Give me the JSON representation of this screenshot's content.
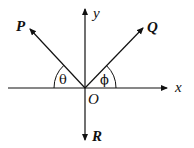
{
  "diagram": {
    "origin_label": "O",
    "axes": {
      "x_label": "x",
      "y_label": "y"
    },
    "vectors": [
      {
        "name": "P",
        "direction": "upper-left"
      },
      {
        "name": "Q",
        "direction": "upper-right"
      },
      {
        "name": "R",
        "direction": "down"
      }
    ],
    "angles": [
      {
        "symbol": "θ",
        "between": "P and negative x-axis"
      },
      {
        "symbol": "ϕ",
        "between": "Q and positive x-axis"
      }
    ],
    "colors": {
      "stroke": "#111111",
      "background": "#ffffff"
    }
  }
}
